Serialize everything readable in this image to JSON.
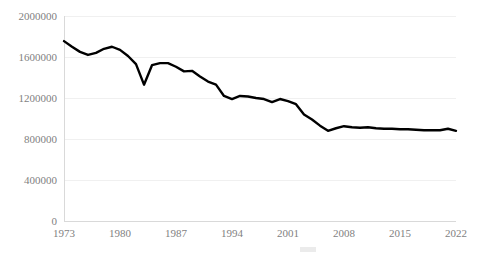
{
  "chart_data": {
    "type": "line",
    "title": "",
    "subtitle": "",
    "xlabel": "",
    "ylabel": "",
    "grid": true,
    "legend": "none",
    "xlim": [
      1973,
      2022
    ],
    "ylim": [
      0,
      2000000
    ],
    "y_ticks": [
      0,
      400000,
      800000,
      1200000,
      1600000,
      2000000
    ],
    "y_tick_labels": [
      "0",
      "400000",
      "800000",
      "1200000",
      "1600000",
      "2000000"
    ],
    "x_ticks": [
      1973,
      1980,
      1987,
      1994,
      2001,
      2008,
      2015,
      2022
    ],
    "x_tick_labels": [
      "1973",
      "1980",
      "1987",
      "1994",
      "2001",
      "2008",
      "2015",
      "2022"
    ],
    "line_color": "#000000",
    "grid_color": "#f0f0f0",
    "axis_color": "#d9d9d9",
    "tick_label_color": "#7f7f7f",
    "x": [
      1973,
      1974,
      1975,
      1976,
      1977,
      1978,
      1979,
      1980,
      1981,
      1982,
      1983,
      1984,
      1985,
      1986,
      1987,
      1988,
      1989,
      1990,
      1991,
      1992,
      1993,
      1994,
      1995,
      1996,
      1997,
      1998,
      1999,
      2000,
      2001,
      2002,
      2003,
      2004,
      2005,
      2006,
      2007,
      2008,
      2009,
      2010,
      2011,
      2012,
      2013,
      2014,
      2015,
      2016,
      2017,
      2018,
      2019,
      2020,
      2021,
      2022
    ],
    "values": [
      1755000,
      1700000,
      1650000,
      1620000,
      1640000,
      1680000,
      1700000,
      1670000,
      1610000,
      1530000,
      1330000,
      1520000,
      1540000,
      1540000,
      1505000,
      1460000,
      1465000,
      1410000,
      1360000,
      1330000,
      1220000,
      1190000,
      1220000,
      1215000,
      1200000,
      1190000,
      1160000,
      1190000,
      1170000,
      1140000,
      1040000,
      990000,
      930000,
      880000,
      905000,
      925000,
      915000,
      910000,
      915000,
      905000,
      900000,
      900000,
      895000,
      895000,
      890000,
      885000,
      885000,
      885000,
      900000,
      880000
    ],
    "series": [
      {
        "name": "annual-series",
        "values": [
          1755000,
          1700000,
          1650000,
          1620000,
          1640000,
          1680000,
          1700000,
          1670000,
          1610000,
          1530000,
          1330000,
          1520000,
          1540000,
          1540000,
          1505000,
          1460000,
          1465000,
          1410000,
          1360000,
          1330000,
          1220000,
          1190000,
          1220000,
          1215000,
          1200000,
          1190000,
          1160000,
          1190000,
          1170000,
          1140000,
          1040000,
          990000,
          930000,
          880000,
          905000,
          925000,
          915000,
          910000,
          915000,
          905000,
          900000,
          900000,
          895000,
          895000,
          890000,
          885000,
          885000,
          885000,
          900000,
          880000
        ]
      }
    ]
  },
  "plot": {
    "left": 64,
    "right": 456,
    "top": 16,
    "bottom": 221
  }
}
